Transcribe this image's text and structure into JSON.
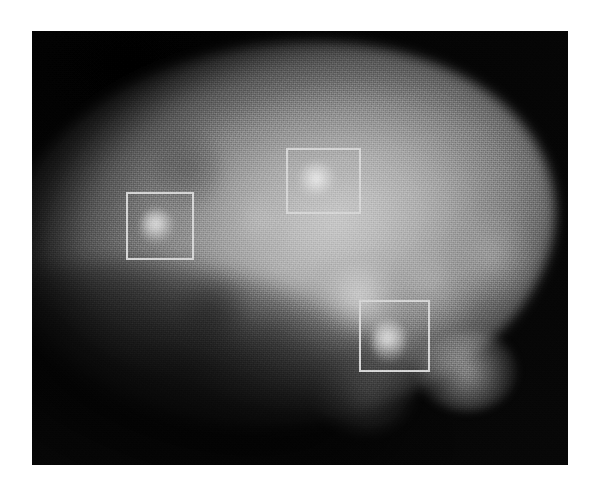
{
  "page": {
    "background_color": "#ffffff",
    "canvas_width": 602,
    "canvas_height": 495
  },
  "scan": {
    "modality_appearance": "grayscale-nuclear-medicine-scan",
    "frame": {
      "left": 32,
      "top": 31,
      "width": 536,
      "height": 434
    },
    "background_color": "#040404",
    "organ_fill_color": "#b4b4b4",
    "annotation_stroke_color": "#d6d6d6",
    "annotation_stroke_width": 2
  },
  "annotations": {
    "count": 3,
    "boxes": [
      {
        "id": "box-1",
        "name": "annotation-box-upper-left",
        "left": 94,
        "top": 161,
        "width": 68,
        "height": 68
      },
      {
        "id": "box-2",
        "name": "annotation-box-upper-middle",
        "left": 254,
        "top": 117,
        "width": 75,
        "height": 66
      },
      {
        "id": "box-3",
        "name": "annotation-box-lower-right",
        "left": 327,
        "top": 269,
        "width": 71,
        "height": 72
      }
    ]
  },
  "focal_spots": [
    {
      "name": "focal-spot-1",
      "left": 108,
      "top": 178,
      "width": 34,
      "height": 34
    },
    {
      "name": "focal-spot-2",
      "left": 266,
      "top": 131,
      "width": 40,
      "height": 38
    },
    {
      "name": "focal-spot-3",
      "left": 340,
      "top": 288,
      "width": 34,
      "height": 44
    }
  ],
  "diffuse_regions": [
    {
      "name": "diffuse-patch-centre",
      "left": 180,
      "top": 250,
      "width": 70,
      "height": 58,
      "variant": "faint"
    },
    {
      "name": "diffuse-patch-mid-right",
      "left": 280,
      "top": 225,
      "width": 95,
      "height": 80,
      "variant": ""
    },
    {
      "name": "diffuse-patch-right",
      "left": 355,
      "top": 205,
      "width": 90,
      "height": 95,
      "variant": "faint"
    },
    {
      "name": "diffuse-patch-far-right",
      "left": 420,
      "top": 180,
      "width": 80,
      "height": 90,
      "variant": "faint"
    },
    {
      "name": "diffuse-patch-lower-right",
      "left": 385,
      "top": 300,
      "width": 100,
      "height": 80,
      "variant": ""
    },
    {
      "name": "diffuse-patch-lower-mid",
      "left": 285,
      "top": 330,
      "width": 95,
      "height": 70,
      "variant": "faint"
    },
    {
      "name": "diffuse-streak-upper-mid",
      "left": 210,
      "top": 140,
      "width": 35,
      "height": 95,
      "variant": "faint"
    },
    {
      "name": "dim-patch-upper-left",
      "left": 120,
      "top": 95,
      "width": 70,
      "height": 85,
      "variant": "dim"
    },
    {
      "name": "dim-patch-mid-left",
      "left": 145,
      "top": 245,
      "width": 70,
      "height": 70,
      "variant": "dim"
    }
  ]
}
